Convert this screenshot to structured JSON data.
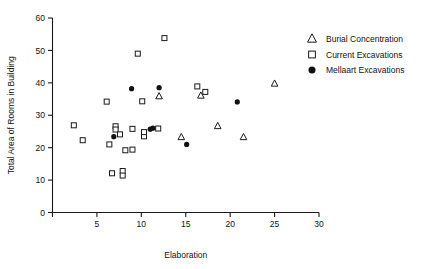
{
  "chart_data": {
    "type": "scatter",
    "title": "",
    "xlabel": "Elaboration",
    "ylabel": "Total Area of Rooms in Building",
    "xlim": [
      0,
      30
    ],
    "ylim": [
      0,
      60
    ],
    "xticks": [
      0,
      5,
      10,
      15,
      20,
      25,
      30
    ],
    "xticklabels": [
      "",
      "5",
      "10",
      "15",
      "20",
      "25",
      "30"
    ],
    "yticks": [
      0,
      10,
      20,
      30,
      40,
      50,
      60
    ],
    "yticklabels": [
      "0",
      "10",
      "20",
      "30",
      "40",
      "50",
      "60"
    ],
    "grid": false,
    "legend_position": "upper right",
    "series": [
      {
        "name": "Burial Concentration",
        "marker": "triangle",
        "points": [
          {
            "x": 12.0,
            "y": 35.8
          },
          {
            "x": 14.5,
            "y": 23.2
          },
          {
            "x": 16.7,
            "y": 36.0
          },
          {
            "x": 18.6,
            "y": 26.6
          },
          {
            "x": 21.5,
            "y": 23.2
          },
          {
            "x": 25.0,
            "y": 39.7
          }
        ]
      },
      {
        "name": "Current Excavations",
        "marker": "square",
        "points": [
          {
            "x": 2.4,
            "y": 26.9
          },
          {
            "x": 3.4,
            "y": 22.3
          },
          {
            "x": 6.1,
            "y": 34.2
          },
          {
            "x": 6.4,
            "y": 21.0
          },
          {
            "x": 6.7,
            "y": 12.1
          },
          {
            "x": 7.1,
            "y": 26.6
          },
          {
            "x": 7.1,
            "y": 25.6
          },
          {
            "x": 7.6,
            "y": 24.1
          },
          {
            "x": 7.9,
            "y": 12.8
          },
          {
            "x": 7.9,
            "y": 11.4
          },
          {
            "x": 8.2,
            "y": 19.2
          },
          {
            "x": 9.0,
            "y": 25.8
          },
          {
            "x": 9.0,
            "y": 19.4
          },
          {
            "x": 9.6,
            "y": 49.0
          },
          {
            "x": 10.1,
            "y": 34.3
          },
          {
            "x": 10.3,
            "y": 23.5
          },
          {
            "x": 10.3,
            "y": 24.8
          },
          {
            "x": 11.9,
            "y": 25.9
          },
          {
            "x": 12.6,
            "y": 53.8
          },
          {
            "x": 16.3,
            "y": 38.9
          },
          {
            "x": 17.2,
            "y": 37.2
          }
        ]
      },
      {
        "name": "Mellaart Excavations",
        "marker": "circle",
        "points": [
          {
            "x": 6.9,
            "y": 23.4
          },
          {
            "x": 8.9,
            "y": 38.2
          },
          {
            "x": 11.0,
            "y": 25.7
          },
          {
            "x": 11.3,
            "y": 26.0
          },
          {
            "x": 12.0,
            "y": 38.5
          },
          {
            "x": 15.1,
            "y": 21.0
          },
          {
            "x": 20.8,
            "y": 34.1
          }
        ]
      }
    ]
  },
  "legend": {
    "items": [
      {
        "label": "Burial Concentration",
        "marker": "triangle"
      },
      {
        "label": "Current Excavations",
        "marker": "square"
      },
      {
        "label": "Mellaart Excavations",
        "marker": "circle"
      }
    ]
  },
  "colors": {
    "axis": "#1a1a1a",
    "text": "#111111",
    "marker_fill": "#111111",
    "marker_open": "#ffffff",
    "background": "#ffffff"
  }
}
